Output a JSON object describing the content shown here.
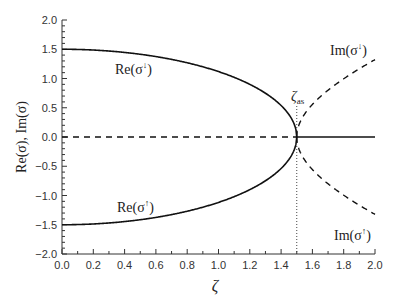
{
  "chart_data": {
    "type": "line",
    "title": "",
    "xlabel": "ζ",
    "ylabel": "Re(σ), Im(σ)",
    "xlim": [
      0.0,
      2.0
    ],
    "ylim": [
      -2.0,
      2.0
    ],
    "grid": false,
    "legend": "inline labels",
    "x_ticks": [
      "0.0",
      "0.2",
      "0.4",
      "0.6",
      "0.8",
      "1.0",
      "1.2",
      "1.4",
      "1.6",
      "1.8",
      "2.0"
    ],
    "y_ticks": [
      "2.0",
      "1.5",
      "1.0",
      "0.5",
      "0.0",
      "-0.5",
      "-1.0",
      "-1.5",
      "-2.0"
    ],
    "critical_point": {
      "label": "ζ_as",
      "x": 1.5,
      "style": "dotted vertical line"
    },
    "series": [
      {
        "name": "Re(σ↓)",
        "style": "solid",
        "x": [
          0.0,
          0.2,
          0.4,
          0.6,
          0.8,
          1.0,
          1.2,
          1.3,
          1.4,
          1.45,
          1.5,
          1.6,
          1.8,
          2.0
        ],
        "y": [
          1.5,
          1.49,
          1.45,
          1.37,
          1.27,
          1.12,
          0.9,
          0.75,
          0.54,
          0.38,
          0.0,
          0.0,
          0.0,
          0.0
        ]
      },
      {
        "name": "Re(σ↑)",
        "style": "solid",
        "x": [
          0.0,
          0.2,
          0.4,
          0.6,
          0.8,
          1.0,
          1.2,
          1.3,
          1.4,
          1.45,
          1.5,
          1.6,
          1.8,
          2.0
        ],
        "y": [
          -1.5,
          -1.49,
          -1.45,
          -1.37,
          -1.27,
          -1.12,
          -0.9,
          -0.75,
          -0.54,
          -0.38,
          0.0,
          0.0,
          0.0,
          0.0
        ]
      },
      {
        "name": "Im(σ↓)",
        "style": "dashed",
        "x": [
          0.0,
          0.5,
          1.0,
          1.5,
          1.55,
          1.6,
          1.7,
          1.8,
          1.9,
          2.0
        ],
        "y": [
          0.0,
          0.0,
          0.0,
          0.0,
          0.39,
          0.56,
          0.8,
          0.99,
          1.17,
          1.32
        ]
      },
      {
        "name": "Im(σ↑)",
        "style": "dashed",
        "x": [
          0.0,
          0.5,
          1.0,
          1.5,
          1.55,
          1.6,
          1.7,
          1.8,
          1.9,
          2.0
        ],
        "y": [
          0.0,
          0.0,
          0.0,
          0.0,
          -0.39,
          -0.56,
          -0.8,
          -0.99,
          -1.17,
          -1.32
        ]
      }
    ],
    "annotations": [
      {
        "text": "Re(σ↓)",
        "x": 0.35,
        "y": 1.1
      },
      {
        "text": "Re(σ↑)",
        "x": 0.35,
        "y": -1.1
      },
      {
        "text": "Im(σ↓)",
        "x": 1.72,
        "y": 1.55
      },
      {
        "text": "Im(σ↑)",
        "x": 1.85,
        "y": -1.65
      },
      {
        "text": "ζas",
        "x": 1.5,
        "y": 0.55
      }
    ]
  },
  "labels": {
    "xlabel": "ζ",
    "ylabel": "Re(σ), Im(σ)",
    "re_down": "Re(σ",
    "re_up": "Re(σ",
    "im_down": "Im(σ",
    "im_up": "Im(σ",
    "zeta_as_main": "ζ",
    "zeta_as_sub": "as",
    "arrow_down": "↓",
    "arrow_up": "↑",
    "close_paren": ")"
  },
  "x_tick_labels": [
    "0.0",
    "0.2",
    "0.4",
    "0.6",
    "0.8",
    "1.0",
    "1.2",
    "1.4",
    "1.6",
    "1.8",
    "2.0"
  ],
  "y_tick_labels": [
    "2.0",
    "1.5",
    "1.0",
    "0.5",
    "0.0",
    "−0.5",
    "−1.0",
    "−1.5",
    "−2.0"
  ]
}
